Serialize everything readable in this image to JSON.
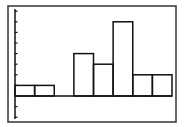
{
  "chart_data": {
    "type": "bar",
    "subtype": "histogram",
    "title": "",
    "xlabel": "",
    "ylabel": "",
    "categories": [
      "1",
      "2",
      "3",
      "4",
      "5",
      "6",
      "7",
      "8"
    ],
    "values": [
      1,
      1,
      0,
      4,
      3,
      7,
      2,
      2
    ],
    "ylim": [
      -2.2,
      8.2
    ],
    "ytick_step": 1,
    "grid": false,
    "legend": null,
    "axis_tick_labels_visible": false
  },
  "style": {
    "stroke_color": "#111111",
    "frame_color": "#333333",
    "background": "#ffffff"
  },
  "layout": {
    "frame": {
      "x": 8,
      "y": 6,
      "w": 168,
      "h": 116
    },
    "plot": {
      "x0": 15,
      "x1": 172,
      "baseline_y": 96,
      "unit_px": 10.6
    },
    "axis_bottom_y": 119,
    "axis_top_y": 9
  }
}
